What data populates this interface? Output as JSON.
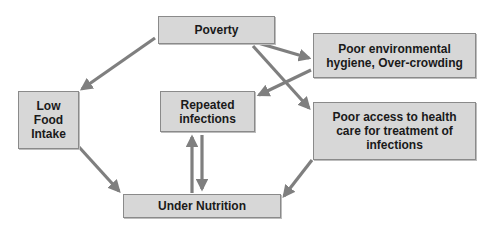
{
  "diagram": {
    "type": "flow-causal-diagram",
    "colors": {
      "box_fill": "#d7d7d7",
      "box_border": "#8a8a8a",
      "arrow": "#7f7f7f",
      "text": "#1a1a1a"
    },
    "nodes": {
      "poverty": {
        "label": "Poverty"
      },
      "hygiene": {
        "label": "Poor environmental hygiene, Over-crowding"
      },
      "low_food": {
        "label": "Low Food Intake"
      },
      "repeated": {
        "label": "Repeated infections"
      },
      "health_care": {
        "label": "Poor access to health care for treatment of infections"
      },
      "under_nutrition": {
        "label": "Under Nutrition"
      }
    },
    "edges": [
      {
        "from": "poverty",
        "to": "low_food"
      },
      {
        "from": "poverty",
        "to": "hygiene"
      },
      {
        "from": "poverty",
        "to": "health_care"
      },
      {
        "from": "hygiene",
        "to": "repeated"
      },
      {
        "from": "low_food",
        "to": "under_nutrition"
      },
      {
        "from": "health_care",
        "to": "under_nutrition"
      },
      {
        "from": "repeated",
        "to": "under_nutrition"
      },
      {
        "from": "under_nutrition",
        "to": "repeated"
      }
    ]
  }
}
